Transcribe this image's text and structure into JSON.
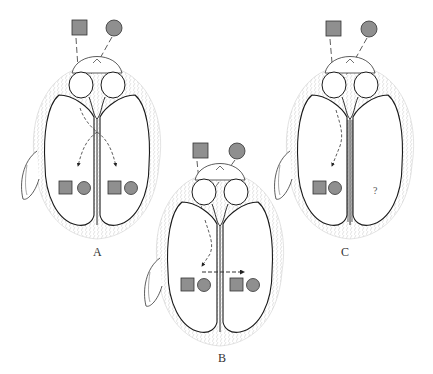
{
  "figure": {
    "colors": {
      "stimulus_fill": "#8f8f8f",
      "stroke": "#1a1a1a",
      "fur": "#bdbdbd"
    },
    "panels": [
      {
        "label": "A",
        "stimuli": [
          "square",
          "circle"
        ],
        "left_hemisphere": [
          "square",
          "circle"
        ],
        "right_hemisphere": [
          "square",
          "circle"
        ],
        "pathway": "both hemispheres via intact callosum (arrows downward to each side)"
      },
      {
        "label": "B",
        "stimuli": [
          "square",
          "circle"
        ],
        "left_hemisphere": [
          "square",
          "circle"
        ],
        "right_hemisphere": [
          "square",
          "circle"
        ],
        "pathway": "one side, transfer across midline (dashed horizontal arrow)"
      },
      {
        "label": "C",
        "stimuli": [
          "square",
          "circle"
        ],
        "left_hemisphere": [
          "square",
          "circle"
        ],
        "right_hemisphere_text": "?",
        "pathway": "one side only; midline split"
      }
    ]
  }
}
